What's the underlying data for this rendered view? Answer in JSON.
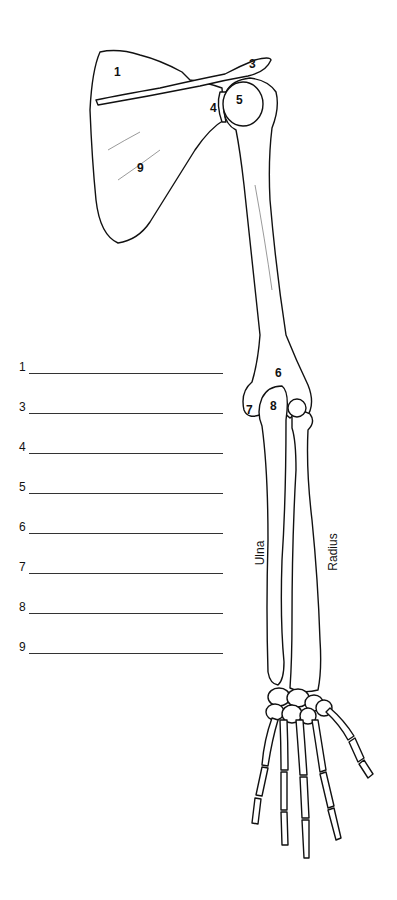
{
  "diagram": {
    "callouts": [
      {
        "label": "1",
        "x": 118,
        "y": 72
      },
      {
        "label": "3",
        "x": 253,
        "y": 64
      },
      {
        "label": "4",
        "x": 214,
        "y": 108
      },
      {
        "label": "5",
        "x": 240,
        "y": 100
      },
      {
        "label": "9",
        "x": 141,
        "y": 168
      },
      {
        "label": "6",
        "x": 279,
        "y": 373
      },
      {
        "label": "7",
        "x": 250,
        "y": 410
      },
      {
        "label": "8",
        "x": 274,
        "y": 406
      }
    ],
    "bone_names": {
      "ulna": "Ulna",
      "radius": "Radius"
    }
  },
  "worksheet": {
    "answer_rows": [
      {
        "number": "1",
        "value": ""
      },
      {
        "number": "3",
        "value": ""
      },
      {
        "number": "4",
        "value": ""
      },
      {
        "number": "5",
        "value": ""
      },
      {
        "number": "6",
        "value": ""
      },
      {
        "number": "7",
        "value": ""
      },
      {
        "number": "8",
        "value": ""
      },
      {
        "number": "9",
        "value": ""
      }
    ]
  }
}
